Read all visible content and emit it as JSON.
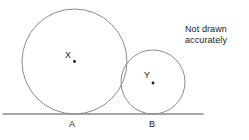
{
  "figure": {
    "type": "geometry-diagram",
    "note": {
      "line1": "Not drawn",
      "line2": "accurately"
    },
    "stroke_color": "#8c8c8c",
    "text_color": "#1a1a1a",
    "background_color": "#ffffff",
    "baseline": {
      "name": "tangent-line",
      "x1": 3,
      "y1": 114,
      "x2": 203,
      "y2": 114
    },
    "circles": [
      {
        "label": "X",
        "center_x": 74.5,
        "center_y": 61.5,
        "radius": 52.5,
        "tangent_point_label": "A",
        "tangent_point_x": 74.5,
        "tangent_point_y": 114
      },
      {
        "label": "Y",
        "center_x": 153,
        "center_y": 82,
        "radius": 32,
        "tangent_point_label": "B",
        "tangent_point_x": 153,
        "tangent_point_y": 114
      }
    ],
    "labels": {
      "circle_x": "X",
      "circle_y": "Y",
      "point_a": "A",
      "point_b": "B"
    }
  }
}
